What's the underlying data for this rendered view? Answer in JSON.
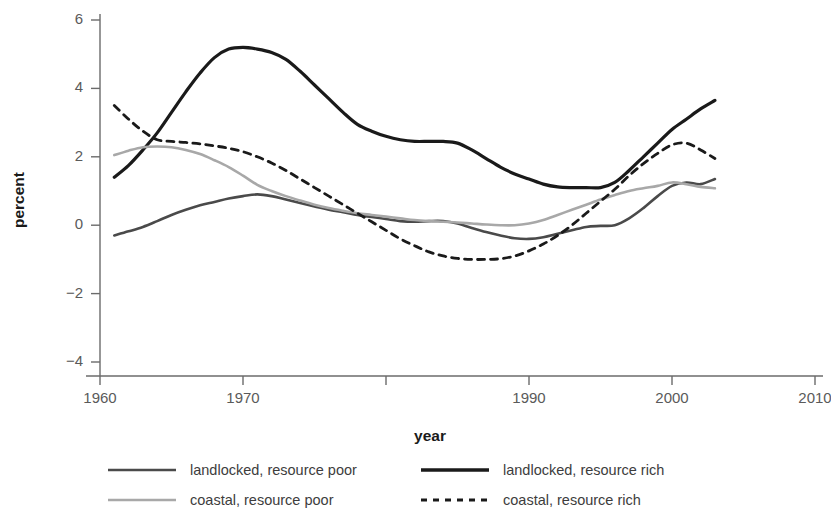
{
  "chart_data": {
    "type": "line",
    "title": "",
    "xlabel": "year",
    "ylabel": "percent",
    "xlim": [
      1960,
      2010
    ],
    "ylim": [
      -4,
      6
    ],
    "grid": false,
    "legend_position": "bottom",
    "xticks": [
      1960,
      1970,
      1980,
      1990,
      2000,
      2010
    ],
    "xtick_labels": [
      "1960",
      "1970",
      "",
      "1990",
      "2000",
      "2010"
    ],
    "yticks": [
      -4,
      -2,
      0,
      2,
      4,
      6
    ],
    "ytick_labels": [
      "−4",
      "−2",
      "0",
      "2",
      "4",
      "6"
    ],
    "series": [
      {
        "name": "landlocked, resource poor",
        "style": "solid",
        "color": "#4a4a4a",
        "width": 2.6,
        "x": [
          1961,
          1962,
          1963,
          1964,
          1965,
          1966,
          1967,
          1968,
          1969,
          1970,
          1971,
          1972,
          1973,
          1974,
          1975,
          1976,
          1977,
          1978,
          1979,
          1980,
          1981,
          1982,
          1983,
          1984,
          1985,
          1986,
          1987,
          1988,
          1989,
          1990,
          1991,
          1992,
          1993,
          1994,
          1995,
          1996,
          1997,
          1998,
          1999,
          2000,
          2001,
          2002,
          2003
        ],
        "values": [
          -0.3,
          -0.18,
          -0.05,
          0.12,
          0.3,
          0.45,
          0.58,
          0.68,
          0.78,
          0.85,
          0.9,
          0.85,
          0.75,
          0.65,
          0.55,
          0.45,
          0.38,
          0.3,
          0.24,
          0.18,
          0.12,
          0.1,
          0.12,
          0.12,
          0.05,
          -0.08,
          -0.2,
          -0.3,
          -0.38,
          -0.4,
          -0.35,
          -0.25,
          -0.15,
          -0.05,
          -0.02,
          0.0,
          0.2,
          0.5,
          0.85,
          1.15,
          1.25,
          1.2,
          1.35
        ]
      },
      {
        "name": "landlocked, resource rich",
        "style": "solid",
        "color": "#1a1a1a",
        "width": 3.2,
        "x": [
          1961,
          1962,
          1963,
          1964,
          1965,
          1966,
          1967,
          1968,
          1969,
          1970,
          1971,
          1972,
          1973,
          1974,
          1975,
          1976,
          1977,
          1978,
          1979,
          1980,
          1981,
          1982,
          1983,
          1984,
          1985,
          1986,
          1987,
          1988,
          1989,
          1990,
          1991,
          1992,
          1993,
          1994,
          1995,
          1996,
          1997,
          1998,
          1999,
          2000,
          2001,
          2002,
          2003
        ],
        "values": [
          1.4,
          1.75,
          2.2,
          2.7,
          3.3,
          3.9,
          4.45,
          4.9,
          5.15,
          5.2,
          5.15,
          5.05,
          4.85,
          4.5,
          4.1,
          3.7,
          3.3,
          2.95,
          2.75,
          2.6,
          2.5,
          2.45,
          2.45,
          2.45,
          2.4,
          2.2,
          1.95,
          1.7,
          1.5,
          1.35,
          1.2,
          1.12,
          1.1,
          1.1,
          1.1,
          1.25,
          1.6,
          2.0,
          2.4,
          2.8,
          3.1,
          3.4,
          3.65
        ]
      },
      {
        "name": "coastal, resource poor",
        "style": "solid",
        "color": "#a8a8a8",
        "width": 2.6,
        "x": [
          1961,
          1962,
          1963,
          1964,
          1965,
          1966,
          1967,
          1968,
          1969,
          1970,
          1971,
          1972,
          1973,
          1974,
          1975,
          1976,
          1977,
          1978,
          1979,
          1980,
          1981,
          1982,
          1983,
          1984,
          1985,
          1986,
          1987,
          1988,
          1989,
          1990,
          1991,
          1992,
          1993,
          1994,
          1995,
          1996,
          1997,
          1998,
          1999,
          2000,
          2001,
          2002,
          2003
        ],
        "values": [
          2.05,
          2.18,
          2.28,
          2.3,
          2.28,
          2.2,
          2.08,
          1.9,
          1.7,
          1.45,
          1.18,
          1.0,
          0.85,
          0.72,
          0.6,
          0.5,
          0.42,
          0.35,
          0.3,
          0.25,
          0.2,
          0.15,
          0.12,
          0.1,
          0.08,
          0.05,
          0.02,
          0.0,
          0.0,
          0.05,
          0.15,
          0.3,
          0.45,
          0.6,
          0.75,
          0.88,
          1.0,
          1.08,
          1.15,
          1.25,
          1.2,
          1.12,
          1.08
        ]
      },
      {
        "name": "coastal, resource rich",
        "style": "dashed",
        "color": "#1a1a1a",
        "width": 2.8,
        "x": [
          1961,
          1962,
          1963,
          1964,
          1965,
          1966,
          1967,
          1968,
          1969,
          1970,
          1971,
          1972,
          1973,
          1974,
          1975,
          1976,
          1977,
          1978,
          1979,
          1980,
          1981,
          1982,
          1983,
          1984,
          1985,
          1986,
          1987,
          1988,
          1989,
          1990,
          1991,
          1992,
          1993,
          1994,
          1995,
          1996,
          1997,
          1998,
          1999,
          2000,
          2001,
          2002,
          2003
        ],
        "values": [
          3.5,
          3.1,
          2.75,
          2.5,
          2.45,
          2.42,
          2.38,
          2.32,
          2.25,
          2.15,
          2.0,
          1.82,
          1.6,
          1.35,
          1.1,
          0.85,
          0.6,
          0.35,
          0.1,
          -0.15,
          -0.4,
          -0.6,
          -0.78,
          -0.9,
          -0.97,
          -1.0,
          -1.0,
          -0.98,
          -0.9,
          -0.75,
          -0.55,
          -0.3,
          0.0,
          0.35,
          0.7,
          1.05,
          1.45,
          1.8,
          2.1,
          2.35,
          2.4,
          2.2,
          1.95
        ]
      }
    ]
  },
  "legend": {
    "entries": [
      {
        "label": "landlocked, resource poor",
        "style": "solid",
        "color": "#4a4a4a",
        "width": 2.6
      },
      {
        "label": "landlocked, resource rich",
        "style": "solid",
        "color": "#1a1a1a",
        "width": 3.4
      },
      {
        "label": "coastal, resource poor",
        "style": "solid",
        "color": "#a8a8a8",
        "width": 2.6
      },
      {
        "label": "coastal, resource rich",
        "style": "dashed",
        "color": "#1a1a1a",
        "width": 2.8
      }
    ]
  },
  "colors": {
    "axis": "#6b6b6b",
    "tick_text": "#5a5a5a",
    "axis_title": "#1a1a1a",
    "legend_text": "#3d3d3d",
    "background": "#ffffff"
  }
}
